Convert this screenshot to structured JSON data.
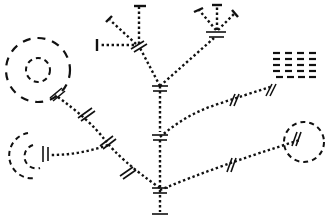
{
  "diagram": {
    "type": "tree-schematic",
    "style": {
      "stroke_color": "#111111",
      "background": "#ffffff"
    },
    "nodes": [
      {
        "id": "trunk-top",
        "kind": "double-bar",
        "x": 160,
        "y": 88
      },
      {
        "id": "trunk-mid",
        "kind": "double-bar",
        "x": 160,
        "y": 137
      },
      {
        "id": "trunk-base",
        "kind": "double-bar",
        "x": 160,
        "y": 190
      },
      {
        "id": "upper-left-hub",
        "kind": "slash-pair",
        "x": 137,
        "y": 44
      },
      {
        "id": "upper-right-hub",
        "kind": "double-bar",
        "x": 216,
        "y": 35
      },
      {
        "id": "left-big-circle",
        "kind": "concentric-dashed-circles",
        "x": 38,
        "y": 71
      },
      {
        "id": "left-small-circle",
        "kind": "dashed-arc",
        "x": 30,
        "y": 152
      },
      {
        "id": "right-circle",
        "kind": "dashed-circle",
        "x": 304,
        "y": 142
      },
      {
        "id": "dash-grid",
        "kind": "dash-grid",
        "x": 290,
        "y": 65,
        "rows": 5,
        "cols": 4
      }
    ],
    "edges": [
      {
        "from": "trunk-top",
        "to": "trunk-mid",
        "style": "dotted"
      },
      {
        "from": "trunk-mid",
        "to": "trunk-base",
        "style": "dotted"
      },
      {
        "from": "trunk-top",
        "to": "upper-left-hub",
        "style": "dotted"
      },
      {
        "from": "trunk-top",
        "to": "upper-right-hub",
        "style": "dotted"
      },
      {
        "from": "trunk-top",
        "to": "dash-grid",
        "style": "dotted"
      },
      {
        "from": "trunk-mid",
        "to": "right-circle",
        "style": "dotted"
      },
      {
        "from": "trunk-base",
        "to": "left-big-circle",
        "style": "dotted"
      },
      {
        "from": "trunk-base",
        "to": "left-small-circle",
        "style": "dotted"
      }
    ]
  }
}
